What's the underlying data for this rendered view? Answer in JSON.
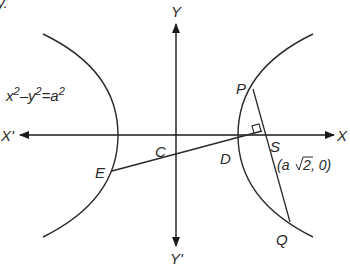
{
  "diagram": {
    "type": "hyperbola-geometry",
    "equation": {
      "x": "x",
      "minus": "–",
      "y": "y",
      "equals": "=",
      "a": "a",
      "exp": "2"
    },
    "axes": {
      "x_pos_label": "X",
      "x_neg_label": "X'",
      "y_pos_label": "Y",
      "y_neg_label": "Y'"
    },
    "points": {
      "P": "P",
      "Q": "Q",
      "S": "S",
      "C": "C",
      "D": "D",
      "E": "E"
    },
    "focus_coord": {
      "open": "(a",
      "sqrt_arg": "2",
      "close": ", 0)"
    },
    "partial_top_left_text": "y.",
    "colors": {
      "stroke": "#2a2a2a",
      "background": "#ffffff"
    }
  }
}
